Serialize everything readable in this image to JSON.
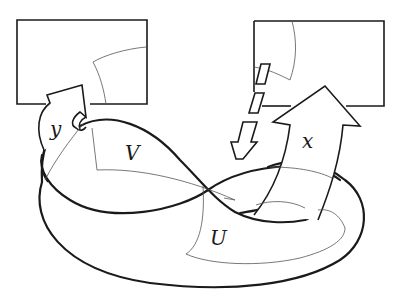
{
  "diagram": {
    "labels": {
      "y": "y",
      "V": "V",
      "x": "x",
      "U": "U"
    },
    "elements": {
      "left_chart": "rectangle",
      "right_chart": "rectangle",
      "arrow_y": "curved arrow from surface into left chart",
      "arrow_x": "curved arrow from surface into right chart",
      "arrow_down": "small dashed/segmented arrow from right chart down to surface",
      "figure_eight": "thick self-crossing curve",
      "outer_surface": "thick oval boundary",
      "region_V": "thin-bordered region",
      "region_U": "thin-bordered region"
    },
    "colors": {
      "stroke": "#1a1a1a",
      "thin_stroke": "#555555",
      "background": "#ffffff"
    }
  }
}
